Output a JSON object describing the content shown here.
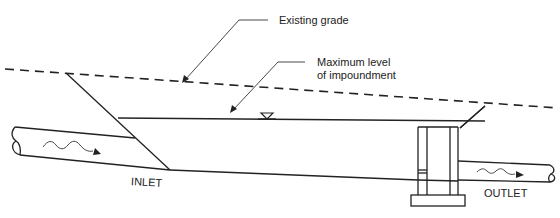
{
  "diagram": {
    "type": "cross-section",
    "labels": {
      "existing_grade": "Existing grade",
      "max_level_line1": "Maximum level",
      "max_level_line2": "of impoundment",
      "inlet": "INLET",
      "outlet": "OUTLET"
    },
    "symbols": {
      "water_level": "inverted-triangle-water-surface-icon",
      "inlet_flow": "wavy-flow-arrow-icon",
      "outlet_flow": "wavy-flow-arrow-icon",
      "pipe_break": "pipe-break-icon"
    },
    "components": [
      {
        "id": "existing-grade",
        "style": "dashed line",
        "description": "Sloping ground surface"
      },
      {
        "id": "max-water-level",
        "style": "solid line",
        "description": "Maximum level of impoundment"
      },
      {
        "id": "inlet-pipe",
        "description": "Pipe entering basin on left"
      },
      {
        "id": "basin-floor",
        "description": "Sloping bottom of basin"
      },
      {
        "id": "outlet-riser",
        "description": "Riser structure with footing on right"
      },
      {
        "id": "outlet-pipe",
        "description": "Pipe leaving riser to the right"
      }
    ],
    "colors": {
      "line": "#222222",
      "background": "#ffffff"
    }
  }
}
